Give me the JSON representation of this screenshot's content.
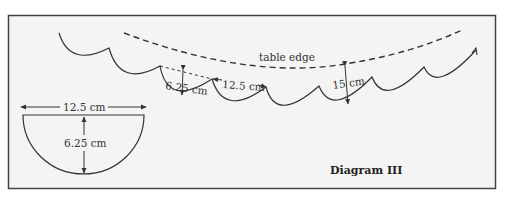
{
  "diagram": {
    "title": "Diagram III",
    "colors": {
      "frame_bg": "#f4f4f4",
      "frame_border": "#444444",
      "stroke": "#333333"
    },
    "labels": {
      "table_edge": "table edge",
      "scallop_depth": "6.25 cm",
      "scallop_width": "12.5 cm",
      "drop_length": "15 cm",
      "template_width": "12.5 cm",
      "template_depth": "6.25 cm"
    },
    "template_shape": {
      "type": "semicircle",
      "diameter_cm": 12.5,
      "radius_cm": 6.25
    },
    "scallop_edge": {
      "scallop_count": 8,
      "scallop_width_cm": 12.5,
      "scallop_depth_cm": 6.25,
      "drop_from_table_edge_cm": 15
    }
  }
}
